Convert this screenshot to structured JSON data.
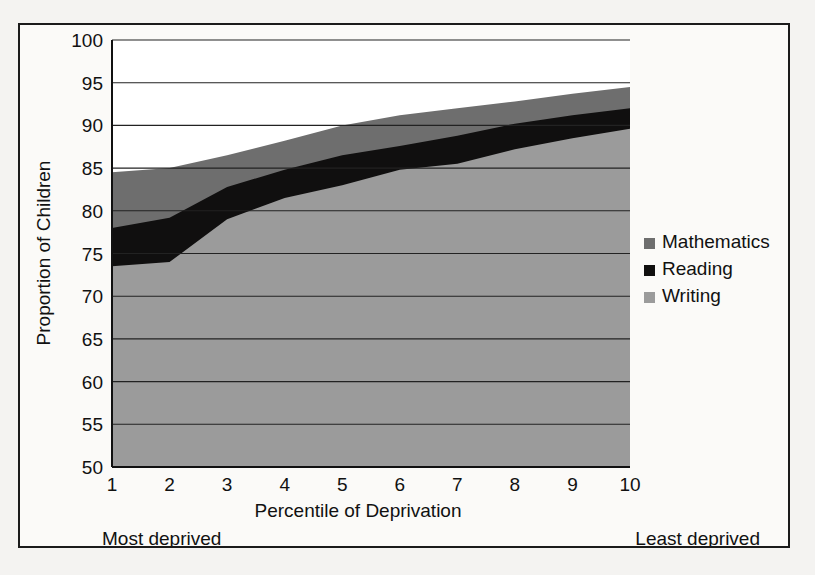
{
  "chart_data": {
    "type": "area",
    "title": "",
    "subtitle": "",
    "xlabel": "Percentile of Deprivation",
    "ylabel": "Proportion of Children",
    "x": [
      1,
      2,
      3,
      4,
      5,
      6,
      7,
      8,
      9,
      10
    ],
    "xticklabels": [
      "1",
      "2",
      "3",
      "4",
      "5",
      "6",
      "7",
      "8",
      "9",
      "10"
    ],
    "yticklabels": [
      "50",
      "55",
      "60",
      "65",
      "70",
      "75",
      "80",
      "85",
      "90",
      "95",
      "100"
    ],
    "yticks": [
      50,
      55,
      60,
      65,
      70,
      75,
      80,
      85,
      90,
      95,
      100
    ],
    "xlim": [
      1,
      10
    ],
    "ylim": [
      50,
      100
    ],
    "grid": "horizontal",
    "stacked": false,
    "note": "Series are cumulative curves drawn as overlapping filled areas from the 50 baseline; values are the upper boundary of each coloured band.",
    "series": [
      {
        "name": "Mathematics",
        "color": "#6e6e6e",
        "values": [
          84.5,
          85.0,
          86.5,
          88.2,
          90.0,
          91.2,
          92.0,
          92.8,
          93.7,
          94.5
        ]
      },
      {
        "name": "Reading",
        "color": "#100f0f",
        "values": [
          78.0,
          79.2,
          82.8,
          84.8,
          86.5,
          87.6,
          88.8,
          90.2,
          91.2,
          92.0
        ]
      },
      {
        "name": "Writing",
        "color": "#9b9b9b",
        "values": [
          73.5,
          74.0,
          79.0,
          81.5,
          83.0,
          84.8,
          85.5,
          87.2,
          88.5,
          89.6
        ]
      }
    ],
    "legend": {
      "position": "right",
      "entries": [
        {
          "label": "Mathematics",
          "color": "#6e6e6e"
        },
        {
          "label": "Reading",
          "color": "#100f0f"
        },
        {
          "label": "Writing",
          "color": "#9b9b9b"
        }
      ]
    },
    "annotations": [
      {
        "text": "Most deprived",
        "position": "bottom-left"
      },
      {
        "text": "Least deprived",
        "position": "bottom-right"
      }
    ]
  }
}
